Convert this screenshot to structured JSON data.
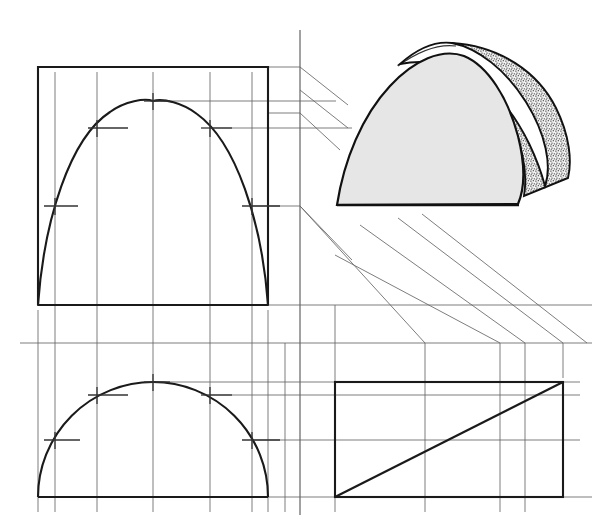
{
  "document": {
    "title": "Orthographic Projection of a Parabolic Half-Dome Wedge",
    "description": "Engineering drawing worksheet showing three orthographic views (top, front, right side) of a half-dome / parabolic wedge solid, plus a shaded pictorial view, connected by projection and miter lines.",
    "canvas": {
      "width": 608,
      "height": 529
    },
    "background_color": "#ffffff"
  },
  "style": {
    "object_line_color": "#1a1a1a",
    "object_line_width": 2.0,
    "projection_line_color": "#555555",
    "projection_line_width": 0.9,
    "construction_line_color": "#666666",
    "construction_line_width": 0.8,
    "tick_color": "#333333",
    "tick_line_width": 1.2,
    "pictorial_outline_color": "#111111",
    "pictorial_fill_light": "#e6e6e6",
    "pictorial_fill_white": "#ffffff",
    "pictorial_stipple_color": "#3a3a3a"
  },
  "geometry": {
    "view_box_left": 38,
    "view_box_right": 268,
    "front_view": {
      "label": "front-view",
      "top_y": 67,
      "base_y": 305,
      "curve_type": "parabola",
      "apex_x": 153,
      "apex_y": 101,
      "ordinate_xs": [
        38,
        55,
        97,
        153,
        210,
        252,
        268
      ],
      "tick_points": [
        {
          "x": 153,
          "y": 101
        },
        {
          "x": 97,
          "y": 128
        },
        {
          "x": 210,
          "y": 128
        },
        {
          "x": 55,
          "y": 206
        },
        {
          "x": 252,
          "y": 206
        }
      ]
    },
    "bottom_view": {
      "label": "bottom-view",
      "base_y": 497,
      "top_y": 382,
      "curve_type": "semicircle",
      "center_x": 153,
      "radius_x": 115,
      "radius_y": 115,
      "tick_points": [
        {
          "x": 153,
          "y": 382
        },
        {
          "x": 97,
          "y": 395
        },
        {
          "x": 210,
          "y": 395
        },
        {
          "x": 55,
          "y": 440
        },
        {
          "x": 252,
          "y": 440
        }
      ]
    },
    "side_view": {
      "label": "side-view",
      "left_x": 335,
      "right_x": 563,
      "top_y": 382,
      "bottom_y": 497,
      "diagonal": {
        "x1": 335,
        "y1": 497,
        "x2": 563,
        "y2": 382
      }
    },
    "miter_vertical_x": 300,
    "miter_vertical_top_y": 30,
    "miter_vertical_bottom_y": 515,
    "horizontal_reference_y": 343,
    "folding_line_y": 305
  },
  "elements": {
    "top_view_box": "top-view-outline-box",
    "front_curve": "front-view-parabola",
    "bottom_curve": "bottom-view-semicircle",
    "side_profile": "side-view-wedge-profile",
    "pictorial": "pictorial-half-dome-wedge",
    "miter_line": "45-degree-miter-line",
    "projection_lines": "projection-lines"
  },
  "projection_lines": {
    "horizontal_from_front": [
      101,
      128,
      206,
      305
    ],
    "horizontal_from_bottom": [
      382,
      395,
      440,
      497
    ],
    "vertical_ordinates": [
      38,
      55,
      97,
      153,
      210,
      252,
      268
    ],
    "diagonal_miter_segments": 4,
    "diagonal_to_side_view": 5
  },
  "pictorial": {
    "label": "shaded-pictorial-half-dome",
    "position": {
      "x": 330,
      "y": 28,
      "width": 240,
      "height": 185
    },
    "front_face_fill": "#e6e6e6",
    "top_surface_fill": "#ffffff",
    "curved_back_fill": "#ededed",
    "stipple_density": "medium",
    "leader_lines": 5
  }
}
